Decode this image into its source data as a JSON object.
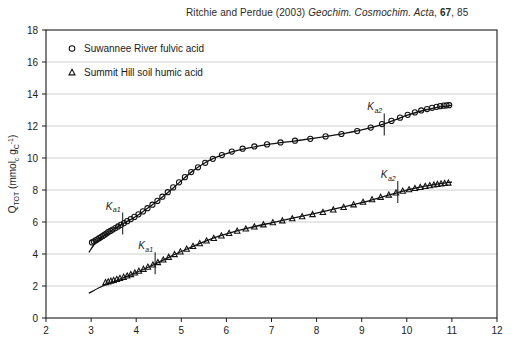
{
  "citation": {
    "authors": "Ritchie and Perdue (2003)",
    "journal": "Geochim. Cosmochim. Acta",
    "volume": "67",
    "page": "85"
  },
  "chart_data": {
    "type": "scatter",
    "title": "",
    "xlabel": "",
    "ylabel": "Q_TOT (mmol_c gC^-1)",
    "ylabel_parts": {
      "symbol": "Q",
      "symbol_sub": "TOT",
      "unit_open": " (mmol",
      "unit_sub1": "c",
      "unit_mid": " g",
      "unit_sub2": "C",
      "unit_sup": "-1",
      "unit_close": ")"
    },
    "xlim": [
      2,
      12
    ],
    "ylim": [
      0,
      18
    ],
    "xticks": [
      2,
      3,
      4,
      5,
      6,
      7,
      8,
      9,
      10,
      11,
      12
    ],
    "yticks": [
      0,
      2,
      4,
      6,
      8,
      10,
      12,
      14,
      16,
      18
    ],
    "grid": "horizontal",
    "legend_position": "top-left",
    "series": [
      {
        "name": "Suwannee River fulvic acid",
        "marker": "open-circle",
        "points": [
          [
            3.02,
            4.72
          ],
          [
            3.06,
            4.78
          ],
          [
            3.1,
            4.85
          ],
          [
            3.14,
            4.92
          ],
          [
            3.18,
            4.99
          ],
          [
            3.22,
            5.06
          ],
          [
            3.26,
            5.13
          ],
          [
            3.3,
            5.21
          ],
          [
            3.34,
            5.28
          ],
          [
            3.38,
            5.36
          ],
          [
            3.43,
            5.44
          ],
          [
            3.48,
            5.53
          ],
          [
            3.54,
            5.62
          ],
          [
            3.6,
            5.72
          ],
          [
            3.66,
            5.82
          ],
          [
            3.73,
            5.93
          ],
          [
            3.8,
            6.05
          ],
          [
            3.88,
            6.18
          ],
          [
            3.96,
            6.32
          ],
          [
            4.05,
            6.48
          ],
          [
            4.15,
            6.66
          ],
          [
            4.25,
            6.86
          ],
          [
            4.36,
            7.08
          ],
          [
            4.47,
            7.32
          ],
          [
            4.58,
            7.58
          ],
          [
            4.7,
            7.86
          ],
          [
            4.82,
            8.16
          ],
          [
            4.95,
            8.48
          ],
          [
            5.08,
            8.8
          ],
          [
            5.22,
            9.12
          ],
          [
            5.37,
            9.42
          ],
          [
            5.53,
            9.7
          ],
          [
            5.7,
            9.95
          ],
          [
            5.9,
            10.18
          ],
          [
            6.12,
            10.4
          ],
          [
            6.36,
            10.58
          ],
          [
            6.62,
            10.72
          ],
          [
            6.9,
            10.85
          ],
          [
            7.2,
            10.97
          ],
          [
            7.52,
            11.08
          ],
          [
            7.86,
            11.2
          ],
          [
            8.2,
            11.35
          ],
          [
            8.55,
            11.5
          ],
          [
            8.9,
            11.68
          ],
          [
            9.2,
            11.9
          ],
          [
            9.45,
            12.12
          ],
          [
            9.66,
            12.32
          ],
          [
            9.85,
            12.52
          ],
          [
            10.02,
            12.7
          ],
          [
            10.18,
            12.85
          ],
          [
            10.32,
            12.97
          ],
          [
            10.45,
            13.06
          ],
          [
            10.56,
            13.14
          ],
          [
            10.66,
            13.2
          ],
          [
            10.74,
            13.24
          ],
          [
            10.82,
            13.27
          ],
          [
            10.88,
            13.29
          ],
          [
            10.94,
            13.3
          ]
        ],
        "fit_curve": [
          [
            2.95,
            4.1
          ],
          [
            3.1,
            4.7
          ],
          [
            3.3,
            5.18
          ],
          [
            3.5,
            5.55
          ],
          [
            3.75,
            5.95
          ],
          [
            4.0,
            6.36
          ],
          [
            4.25,
            6.86
          ],
          [
            4.5,
            7.38
          ],
          [
            4.75,
            7.95
          ],
          [
            5.0,
            8.58
          ],
          [
            5.25,
            9.18
          ],
          [
            5.5,
            9.66
          ],
          [
            5.75,
            10.02
          ],
          [
            6.0,
            10.28
          ],
          [
            6.25,
            10.48
          ],
          [
            6.5,
            10.63
          ],
          [
            7.0,
            10.88
          ],
          [
            7.5,
            11.06
          ],
          [
            8.0,
            11.26
          ],
          [
            8.5,
            11.48
          ],
          [
            9.0,
            11.76
          ],
          [
            9.5,
            12.14
          ],
          [
            10.0,
            12.66
          ],
          [
            10.4,
            13.0
          ],
          [
            10.7,
            13.18
          ],
          [
            11.0,
            13.3
          ]
        ],
        "annotation": [
          {
            "label": "K",
            "sub": "a1",
            "x": 3.7,
            "y": 5.9
          },
          {
            "label": "K",
            "sub": "a2",
            "x": 9.5,
            "y": 12.1
          }
        ]
      },
      {
        "name": "Summit Hill soil humic acid",
        "marker": "open-triangle",
        "points": [
          [
            3.32,
            2.22
          ],
          [
            3.38,
            2.26
          ],
          [
            3.44,
            2.31
          ],
          [
            3.5,
            2.36
          ],
          [
            3.57,
            2.42
          ],
          [
            3.64,
            2.48
          ],
          [
            3.72,
            2.55
          ],
          [
            3.8,
            2.63
          ],
          [
            3.88,
            2.72
          ],
          [
            3.97,
            2.82
          ],
          [
            4.06,
            2.93
          ],
          [
            4.16,
            3.05
          ],
          [
            4.26,
            3.18
          ],
          [
            4.37,
            3.32
          ],
          [
            4.48,
            3.47
          ],
          [
            4.6,
            3.63
          ],
          [
            4.72,
            3.8
          ],
          [
            4.85,
            3.97
          ],
          [
            4.98,
            4.14
          ],
          [
            5.12,
            4.31
          ],
          [
            5.26,
            4.48
          ],
          [
            5.41,
            4.65
          ],
          [
            5.56,
            4.82
          ],
          [
            5.72,
            4.98
          ],
          [
            5.89,
            5.14
          ],
          [
            6.06,
            5.29
          ],
          [
            6.24,
            5.43
          ],
          [
            6.43,
            5.57
          ],
          [
            6.62,
            5.7
          ],
          [
            6.82,
            5.83
          ],
          [
            7.03,
            5.96
          ],
          [
            7.24,
            6.08
          ],
          [
            7.46,
            6.21
          ],
          [
            7.68,
            6.34
          ],
          [
            7.91,
            6.47
          ],
          [
            8.14,
            6.61
          ],
          [
            8.37,
            6.76
          ],
          [
            8.6,
            6.92
          ],
          [
            8.82,
            7.08
          ],
          [
            9.03,
            7.24
          ],
          [
            9.23,
            7.4
          ],
          [
            9.42,
            7.55
          ],
          [
            9.6,
            7.69
          ],
          [
            9.76,
            7.82
          ],
          [
            9.91,
            7.93
          ],
          [
            10.05,
            8.02
          ],
          [
            10.18,
            8.1
          ],
          [
            10.3,
            8.17
          ],
          [
            10.41,
            8.23
          ],
          [
            10.51,
            8.28
          ],
          [
            10.6,
            8.32
          ],
          [
            10.68,
            8.36
          ],
          [
            10.76,
            8.39
          ],
          [
            10.84,
            8.42
          ],
          [
            10.92,
            8.44
          ]
        ],
        "fit_curve": [
          [
            2.95,
            1.55
          ],
          [
            3.2,
            1.92
          ],
          [
            3.45,
            2.22
          ],
          [
            3.7,
            2.5
          ],
          [
            4.0,
            2.84
          ],
          [
            4.3,
            3.22
          ],
          [
            4.6,
            3.62
          ],
          [
            4.9,
            4.03
          ],
          [
            5.2,
            4.4
          ],
          [
            5.5,
            4.76
          ],
          [
            5.8,
            5.08
          ],
          [
            6.1,
            5.34
          ],
          [
            6.5,
            5.63
          ],
          [
            7.0,
            5.95
          ],
          [
            7.5,
            6.26
          ],
          [
            8.0,
            6.56
          ],
          [
            8.5,
            6.88
          ],
          [
            9.0,
            7.21
          ],
          [
            9.5,
            7.6
          ],
          [
            10.0,
            7.99
          ],
          [
            10.4,
            8.24
          ],
          [
            10.7,
            8.38
          ],
          [
            11.0,
            8.5
          ]
        ],
        "annotation": [
          {
            "label": "K",
            "sub": "a1",
            "x": 4.42,
            "y": 3.42
          },
          {
            "label": "K",
            "sub": "a2",
            "x": 9.8,
            "y": 7.88
          }
        ]
      }
    ],
    "legend": [
      {
        "marker": "open-circle",
        "label": "Suwannee River fulvic acid"
      },
      {
        "marker": "open-triangle",
        "label": "Summit Hill soil humic acid"
      }
    ]
  },
  "colors": {
    "axis": "#1a1a1a",
    "grid": "#b8b8b8",
    "marker": "#111111",
    "curve": "#111111",
    "background": "#ffffff"
  }
}
